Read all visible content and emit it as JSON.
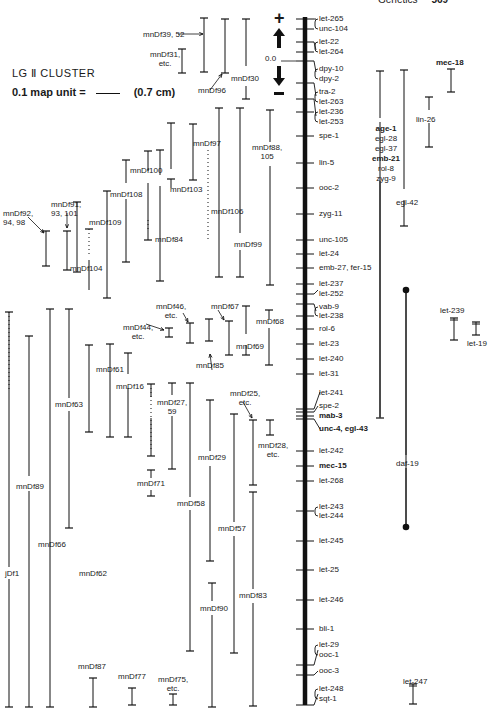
{
  "header": {
    "journal": "Genetics",
    "page": "569"
  },
  "title": "LG Ⅱ CLUSTER",
  "scale": {
    "label": "0.1 map unit =",
    "cm": "(0.7 cm)"
  },
  "orientation": {
    "plus": "+",
    "minus": "−",
    "zero": "0.0"
  },
  "genes": [
    {
      "name": "let-265",
      "y": 19
    },
    {
      "name": "unc-104",
      "y": 29
    },
    {
      "name": "let-22",
      "y": 42
    },
    {
      "name": "let-264",
      "y": 52
    },
    {
      "name": "dpy-10",
      "y": 69
    },
    {
      "name": "dpy-2",
      "y": 79
    },
    {
      "name": "tra-2",
      "y": 92
    },
    {
      "name": "let-263",
      "y": 102
    },
    {
      "name": "let-236",
      "y": 112
    },
    {
      "name": "let-253",
      "y": 122
    },
    {
      "name": "spe-1",
      "y": 136
    },
    {
      "name": "lin-5",
      "y": 163
    },
    {
      "name": "ooc-2",
      "y": 188
    },
    {
      "name": "zyg-11",
      "y": 214
    },
    {
      "name": "unc-105",
      "y": 240
    },
    {
      "name": "let-24",
      "y": 254
    },
    {
      "name": "emb-27,  fer-15",
      "y": 268
    },
    {
      "name": "let-237",
      "y": 284
    },
    {
      "name": "let-252",
      "y": 294
    },
    {
      "name": "vab-9",
      "y": 307
    },
    {
      "name": "let-238",
      "y": 316
    },
    {
      "name": "rol-6",
      "y": 329
    },
    {
      "name": "let-23",
      "y": 344
    },
    {
      "name": "let-240",
      "y": 359
    },
    {
      "name": "let-31",
      "y": 374
    },
    {
      "name": "let-241",
      "y": 393
    },
    {
      "name": "spe-2",
      "y": 406
    },
    {
      "name": "mab-3",
      "y": 416
    },
    {
      "name": "unc-4,  egl-43",
      "y": 429
    },
    {
      "name": "let-242",
      "y": 451
    },
    {
      "name": "mec-15",
      "y": 466
    },
    {
      "name": "let-268",
      "y": 481
    },
    {
      "name": "let-243",
      "y": 507
    },
    {
      "name": "let-244",
      "y": 516
    },
    {
      "name": "let-245",
      "y": 541
    },
    {
      "name": "let-25",
      "y": 570
    },
    {
      "name": "let-246",
      "y": 600
    },
    {
      "name": "bli-1",
      "y": 629
    },
    {
      "name": "let-29",
      "y": 645
    },
    {
      "name": "ooc-1",
      "y": 655
    },
    {
      "name": "ooc-3",
      "y": 671
    },
    {
      "name": "let-248",
      "y": 689
    },
    {
      "name": "sqt-1",
      "y": 699
    }
  ],
  "bold_genes": [
    "mab-3",
    "unc-4,  egl-43",
    "mec-15"
  ],
  "right_genes": {
    "cluster": [
      "age-1",
      "egl-28",
      "egl-37",
      "emb-21",
      "rol-8",
      "zyg-9"
    ],
    "cluster_bold": [
      "age-1",
      "emb-21"
    ],
    "egl_42": "egl-42",
    "lin_26": "lin-26",
    "mec_18": "mec-18",
    "daf_19": "daf-19",
    "let_239": "let-239",
    "let_19": "let-19",
    "let_247": "let-247"
  },
  "deficiencies": [
    {
      "name": "mnDf39, 52"
    },
    {
      "name": "mnDf31, etc."
    },
    {
      "name": "mnDf96"
    },
    {
      "name": "mnDf30"
    },
    {
      "name": "mnDf97"
    },
    {
      "name": "mnDf88, 105"
    },
    {
      "name": "mnDf100"
    },
    {
      "name": "mnDf103"
    },
    {
      "name": "mnDf108"
    },
    {
      "name": "mnDf106"
    },
    {
      "name": "mnDf84"
    },
    {
      "name": "mnDf99"
    },
    {
      "name": "mnDf109"
    },
    {
      "name": "mnDf92, 94, 98"
    },
    {
      "name": "mnDf91, 93, 101"
    },
    {
      "name": "mnDf104"
    },
    {
      "name": "mnDf46, etc."
    },
    {
      "name": "mnDf67"
    },
    {
      "name": "mnDf44, etc."
    },
    {
      "name": "mnDf68"
    },
    {
      "name": "mnDf85"
    },
    {
      "name": "mnDf69"
    },
    {
      "name": "mnDf61"
    },
    {
      "name": "mnDf16"
    },
    {
      "name": "mnDf63"
    },
    {
      "name": "mnDf27, 59"
    },
    {
      "name": "mnDf25, etc."
    },
    {
      "name": "mnDf28, etc."
    },
    {
      "name": "mnDf71"
    },
    {
      "name": "mnDf29"
    },
    {
      "name": "mnDf89"
    },
    {
      "name": "mnDf58"
    },
    {
      "name": "mnDf57"
    },
    {
      "name": "mnDf66"
    },
    {
      "name": "jDf1"
    },
    {
      "name": "mnDf62"
    },
    {
      "name": "mnDf90"
    },
    {
      "name": "mnDf83"
    },
    {
      "name": "mnDf87"
    },
    {
      "name": "mnDf77"
    },
    {
      "name": "mnDf75, etc."
    }
  ],
  "labels": {
    "mnDf39": "mnDf39, 52",
    "mnDf31a": "mnDf31,",
    "mnDf31b": "etc.",
    "mnDf96": "mnDf96",
    "mnDf30": "mnDf30",
    "mnDf97": "mnDf97",
    "mnDf88a": "mnDf88,",
    "mnDf88b": "105",
    "mnDf100": "mnDf100",
    "mnDf103": "mnDf103",
    "mnDf108": "mnDf108",
    "mnDf106": "mnDf106",
    "mnDf84": "mnDf84",
    "mnDf99": "mnDf99",
    "mnDf109": "mnDf109",
    "mnDf92a": "mnDf92,",
    "mnDf92b": "94, 98",
    "mnDf91a": "mnDf91,",
    "mnDf91b": "93, 101",
    "mnDf104": "mnDf104",
    "mnDf46a": "mnDf46,",
    "mnDf46b": "etc.",
    "mnDf67": "mnDf67",
    "mnDf44a": "mnDf44,",
    "mnDf44b": "etc.",
    "mnDf68": "mnDf68",
    "mnDf85": "mnDf85",
    "mnDf69": "mnDf69",
    "mnDf61": "mnDf61",
    "mnDf16": "mnDf16",
    "mnDf63": "mnDf63",
    "mnDf27a": "mnDf27,",
    "mnDf27b": "59",
    "mnDf25a": "mnDf25,",
    "mnDf25b": "etc.",
    "mnDf28a": "mnDf28,",
    "mnDf28b": "etc.",
    "mnDf71": "mnDf71",
    "mnDf29": "mnDf29",
    "mnDf89": "mnDf89",
    "mnDf58": "mnDf58",
    "mnDf57": "mnDf57",
    "mnDf66": "mnDf66",
    "jDf1": "jDf1",
    "mnDf62": "mnDf62",
    "mnDf90": "mnDf90",
    "mnDf83": "mnDf83",
    "mnDf87": "mnDf87",
    "mnDf77": "mnDf77",
    "mnDf75a": "mnDf75,",
    "mnDf75b": "etc."
  }
}
